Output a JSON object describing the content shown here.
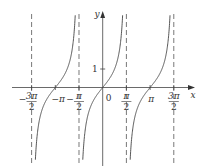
{
  "chart_data": {
    "type": "line",
    "title": "",
    "function": "y = tan x",
    "xlabel": "x",
    "ylabel": "y",
    "origin_label": "0",
    "x_ticks": [
      {
        "value": -4.712,
        "label_num": "3π",
        "label_den": "2",
        "sign": "−"
      },
      {
        "value": -3.1416,
        "label_num": "−π",
        "label_den": "",
        "sign": ""
      },
      {
        "value": -1.5708,
        "label_num": "π",
        "label_den": "2",
        "sign": "−"
      },
      {
        "value": 1.5708,
        "label_num": "π",
        "label_den": "2",
        "sign": ""
      },
      {
        "value": 3.1416,
        "label_num": "π",
        "label_den": "",
        "sign": ""
      },
      {
        "value": 4.712,
        "label_num": "3π",
        "label_den": "2",
        "sign": ""
      }
    ],
    "y_ticks": [
      {
        "value": 1,
        "label": "1"
      }
    ],
    "asymptotes": [
      -4.712,
      -1.5708,
      1.5708,
      4.712
    ],
    "xlim": [
      -5.0,
      5.1
    ],
    "ylim": [
      -3.8,
      4.0
    ],
    "grid": false,
    "line_color": "#444444",
    "asymptote_color": "#555555",
    "series": [
      {
        "name": "tan x on (-3π/2, -π/2)",
        "x": [
          -4.55,
          -4.2,
          -3.8,
          -3.1416,
          -2.5,
          -2.1,
          -1.73
        ],
        "y": [
          -6,
          -1.78,
          -0.81,
          0,
          0.75,
          1.71,
          6
        ]
      },
      {
        "name": "tan x on (-π/2, π/2)",
        "x": [
          -1.41,
          -1.05,
          -0.6,
          0,
          0.6,
          1.05,
          1.41
        ],
        "y": [
          -6,
          -1.74,
          -0.68,
          0,
          0.68,
          1.74,
          6
        ]
      },
      {
        "name": "tan x on (π/2, 3π/2)",
        "x": [
          1.73,
          2.1,
          2.5,
          3.1416,
          3.8,
          4.2,
          4.55
        ],
        "y": [
          -6,
          -1.71,
          -0.75,
          0,
          0.81,
          1.78,
          6
        ]
      }
    ]
  }
}
